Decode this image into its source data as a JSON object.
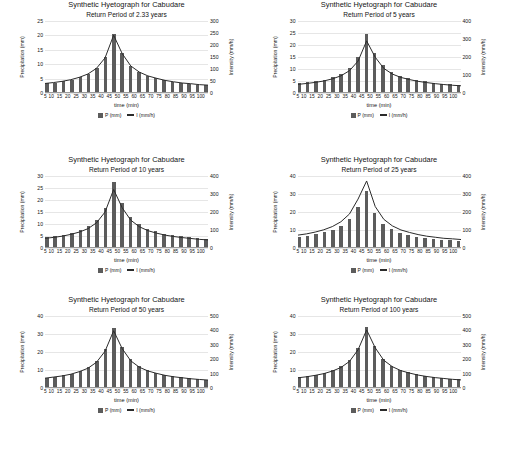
{
  "document": {
    "kind": "scanned-figure-page",
    "panel_count": 6
  },
  "legend": {
    "precip_label": "P (mm)",
    "intensity_label": "I (mm/h)",
    "bar_color": "#5c5c5c",
    "line_color": "#2b2b2b"
  },
  "common": {
    "title": "Synthetic Hyetograph for Cabudare",
    "xlabel": "time (min)",
    "ylabel_left": "Precipitation (mm)",
    "ylabel_right": "Intensity (mm/h)",
    "x": [
      5,
      10,
      15,
      20,
      25,
      30,
      35,
      40,
      45,
      50,
      55,
      60,
      65,
      70,
      75,
      80,
      85,
      90,
      95,
      100
    ]
  },
  "chart_data": [
    {
      "type": "bar",
      "title": "Synthetic Hyetograph for Cabudare",
      "subtitle": "Return Period of 2.33 years",
      "xlabel": "time (min)",
      "ylabel": "Precipitation (mm)",
      "ylabel_secondary": "Intensity (mm/h)",
      "categories": [
        5,
        10,
        15,
        20,
        25,
        30,
        35,
        40,
        45,
        50,
        55,
        60,
        65,
        70,
        75,
        80,
        85,
        90,
        95,
        100
      ],
      "yticks_left": [
        0,
        5,
        10,
        15,
        20,
        25
      ],
      "yticks_right": [
        0,
        50,
        100,
        150,
        200,
        250,
        300
      ],
      "ylim": [
        0,
        25
      ],
      "ylim_secondary": [
        0,
        300
      ],
      "grid": true,
      "legend_position": "bottom",
      "series": [
        {
          "name": "P (mm)",
          "type": "bar",
          "values": [
            3.0,
            3.3,
            3.7,
            4.3,
            5.1,
            6.3,
            8.3,
            12.0,
            20.0,
            13.5,
            9.2,
            7.0,
            5.7,
            4.8,
            4.1,
            3.6,
            3.2,
            2.9,
            2.6,
            2.4
          ]
        },
        {
          "name": "I (mm/h)",
          "type": "line",
          "values": [
            36,
            40,
            45,
            52,
            62,
            76,
            100,
            144,
            240,
            162,
            110,
            84,
            68,
            58,
            49,
            43,
            38,
            35,
            31,
            29
          ]
        }
      ]
    },
    {
      "type": "bar",
      "title": "Synthetic Hyetograph for Cabudare",
      "subtitle": "Return Period of 5 years",
      "xlabel": "time (min)",
      "ylabel": "Precipitation (mm)",
      "ylabel_secondary": "Intensity (mm/h)",
      "categories": [
        5,
        10,
        15,
        20,
        25,
        30,
        35,
        40,
        45,
        50,
        55,
        60,
        65,
        70,
        75,
        80,
        85,
        90,
        95,
        100
      ],
      "yticks_left": [
        0,
        5,
        10,
        15,
        20,
        25,
        30
      ],
      "yticks_right": [
        0,
        100,
        200,
        300,
        400
      ],
      "ylim": [
        0,
        30
      ],
      "ylim_secondary": [
        0,
        400
      ],
      "grid": true,
      "legend_position": "bottom",
      "series": [
        {
          "name": "P (mm)",
          "type": "bar",
          "values": [
            3.6,
            4.0,
            4.5,
            5.2,
            6.2,
            7.6,
            10.0,
            14.5,
            24.0,
            16.3,
            11.1,
            8.4,
            6.8,
            5.8,
            5.0,
            4.4,
            3.9,
            3.5,
            3.2,
            2.9
          ]
        },
        {
          "name": "I (mm/h)",
          "type": "line",
          "values": [
            43,
            48,
            54,
            62,
            74,
            91,
            120,
            174,
            288,
            196,
            133,
            101,
            82,
            70,
            60,
            53,
            47,
            42,
            38,
            35
          ]
        }
      ]
    },
    {
      "type": "bar",
      "title": "Synthetic Hyetograph for Cabudare",
      "subtitle": "Return Period of 10 years",
      "xlabel": "time (min)",
      "ylabel": "Precipitation (mm)",
      "ylabel_secondary": "Intensity (mm/h)",
      "categories": [
        5,
        10,
        15,
        20,
        25,
        30,
        35,
        40,
        45,
        50,
        55,
        60,
        65,
        70,
        75,
        80,
        85,
        90,
        95,
        100
      ],
      "yticks_left": [
        0,
        5,
        10,
        15,
        20,
        25,
        30
      ],
      "yticks_right": [
        0,
        100,
        200,
        300,
        400
      ],
      "ylim": [
        0,
        30
      ],
      "ylim_secondary": [
        0,
        400
      ],
      "grid": true,
      "legend_position": "bottom",
      "series": [
        {
          "name": "P (mm)",
          "type": "bar",
          "values": [
            4.1,
            4.5,
            5.1,
            5.9,
            7.0,
            8.6,
            11.3,
            16.4,
            27.0,
            18.4,
            12.6,
            9.5,
            7.7,
            6.5,
            5.6,
            4.9,
            4.4,
            4.0,
            3.6,
            3.3
          ]
        },
        {
          "name": "I (mm/h)",
          "type": "line",
          "values": [
            49,
            54,
            61,
            71,
            84,
            103,
            136,
            197,
            324,
            221,
            151,
            114,
            92,
            78,
            67,
            59,
            53,
            48,
            43,
            40
          ]
        }
      ]
    },
    {
      "type": "bar",
      "title": "Synthetic Hyetograph for Cabudare",
      "subtitle": "Return Period of 25 years",
      "xlabel": "time (min)",
      "ylabel": "Precipitation (mm)",
      "ylabel_secondary": "Intensity (mm/h)",
      "categories": [
        5,
        10,
        15,
        20,
        25,
        30,
        35,
        40,
        45,
        50,
        55,
        60,
        65,
        70,
        75,
        80,
        85,
        90,
        95,
        100
      ],
      "yticks_left": [
        0,
        10,
        20,
        30,
        40
      ],
      "yticks_right": [
        0,
        100,
        200,
        300,
        400
      ],
      "ylim": [
        0,
        40
      ],
      "ylim_secondary": [
        0,
        400
      ],
      "grid": true,
      "legend_position": "bottom",
      "series": [
        {
          "name": "P (mm)",
          "type": "bar",
          "values": [
            5.6,
            6.2,
            7.0,
            8.1,
            9.6,
            11.8,
            15.5,
            22.5,
            31.0,
            19.0,
            13.0,
            9.9,
            8.0,
            6.8,
            5.8,
            5.1,
            4.6,
            4.1,
            3.8,
            3.5
          ]
        },
        {
          "name": "I (mm/h)",
          "type": "line",
          "values": [
            67,
            74,
            84,
            97,
            115,
            142,
            186,
            270,
            372,
            228,
            156,
            119,
            96,
            82,
            70,
            61,
            55,
            49,
            46,
            42
          ]
        }
      ]
    },
    {
      "type": "bar",
      "title": "Synthetic Hyetograph for Cabudare",
      "subtitle": "Return Period of 50 years",
      "xlabel": "time (min)",
      "ylabel": "Precipitation (mm)",
      "ylabel_secondary": "Intensity (mm/h)",
      "categories": [
        5,
        10,
        15,
        20,
        25,
        30,
        35,
        40,
        45,
        50,
        55,
        60,
        65,
        70,
        75,
        80,
        85,
        90,
        95,
        100
      ],
      "yticks_left": [
        0,
        10,
        20,
        30,
        40
      ],
      "yticks_right": [
        0,
        100,
        200,
        300,
        400,
        500
      ],
      "ylim": [
        0,
        40
      ],
      "ylim_secondary": [
        0,
        500
      ],
      "grid": true,
      "legend_position": "bottom",
      "series": [
        {
          "name": "P (mm)",
          "type": "bar",
          "values": [
            5.2,
            5.8,
            6.5,
            7.5,
            9.0,
            11.0,
            14.5,
            21.0,
            33.0,
            22.5,
            15.3,
            11.6,
            9.4,
            8.0,
            6.8,
            6.0,
            5.4,
            4.8,
            4.4,
            4.1
          ]
        },
        {
          "name": "I (mm/h)",
          "type": "line",
          "values": [
            62,
            70,
            78,
            90,
            108,
            132,
            174,
            252,
            396,
            270,
            184,
            139,
            113,
            96,
            82,
            72,
            65,
            58,
            53,
            49
          ]
        }
      ]
    },
    {
      "type": "bar",
      "title": "Synthetic Hyetograph for Cabudare",
      "subtitle": "Return Period of 100 years",
      "xlabel": "time (min)",
      "ylabel": "Precipitation (mm)",
      "ylabel_secondary": "Intensity (mm/h)",
      "categories": [
        5,
        10,
        15,
        20,
        25,
        30,
        35,
        40,
        45,
        50,
        55,
        60,
        65,
        70,
        75,
        80,
        85,
        90,
        95,
        100
      ],
      "yticks_left": [
        0,
        10,
        20,
        30,
        40
      ],
      "yticks_right": [
        0,
        100,
        200,
        300,
        400,
        500
      ],
      "ylim": [
        0,
        40
      ],
      "ylim_secondary": [
        0,
        500
      ],
      "grid": true,
      "legend_position": "bottom",
      "series": [
        {
          "name": "P (mm)",
          "type": "bar",
          "values": [
            5.4,
            6.0,
            6.8,
            7.8,
            9.3,
            11.4,
            15.0,
            21.8,
            33.5,
            23.0,
            15.7,
            11.9,
            9.6,
            8.2,
            7.0,
            6.2,
            5.5,
            5.0,
            4.5,
            4.2
          ]
        },
        {
          "name": "I (mm/h)",
          "type": "line",
          "values": [
            65,
            72,
            82,
            94,
            112,
            137,
            180,
            262,
            402,
            276,
            188,
            143,
            115,
            98,
            84,
            74,
            66,
            60,
            54,
            50
          ]
        }
      ]
    }
  ]
}
